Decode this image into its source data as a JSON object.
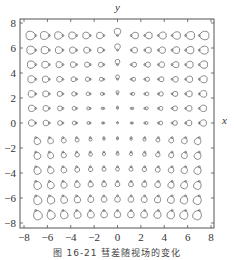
{
  "chart_data": {
    "type": "scatter",
    "title": "",
    "subtitle": "Comet-shaped loops (spin/polarization field) on a 13x13 grid",
    "xlabel": "x",
    "ylabel": "y",
    "xlim": [
      -8,
      8
    ],
    "ylim": [
      -8,
      8
    ],
    "xticks": [
      -8,
      -6,
      -4,
      -2,
      0,
      2,
      4,
      6,
      8
    ],
    "yticks": [
      -8,
      -6,
      -4,
      -2,
      0,
      2,
      4,
      6,
      8
    ],
    "grid": false,
    "legend": null,
    "grid_points": {
      "x": [
        -7,
        -5.83,
        -4.67,
        -3.5,
        -2.33,
        -1.17,
        0,
        1.17,
        2.33,
        3.5,
        4.67,
        5.83,
        7
      ],
      "y": [
        7,
        5.83,
        4.67,
        3.5,
        2.33,
        1.17,
        0,
        -1.17,
        -2.33,
        -3.5,
        -4.67,
        -5.83,
        -7
      ]
    },
    "glyph_description": "Each grid point carries a small teardrop/loop; loop size grows with distance from origin; upper half loops lie horizontally, lower half loops hang downward"
  },
  "axes": {
    "x_label": "x",
    "y_label": "y",
    "x_tick_labels": [
      "-8",
      "-6",
      "-4",
      "-2",
      "0",
      "2",
      "4",
      "6",
      "8"
    ],
    "y_tick_labels": [
      "8",
      "6",
      "4",
      "2",
      "0",
      "-2",
      "-4",
      "-6",
      "-8"
    ]
  },
  "caption": "图 16-21  彗差随视场的变化"
}
